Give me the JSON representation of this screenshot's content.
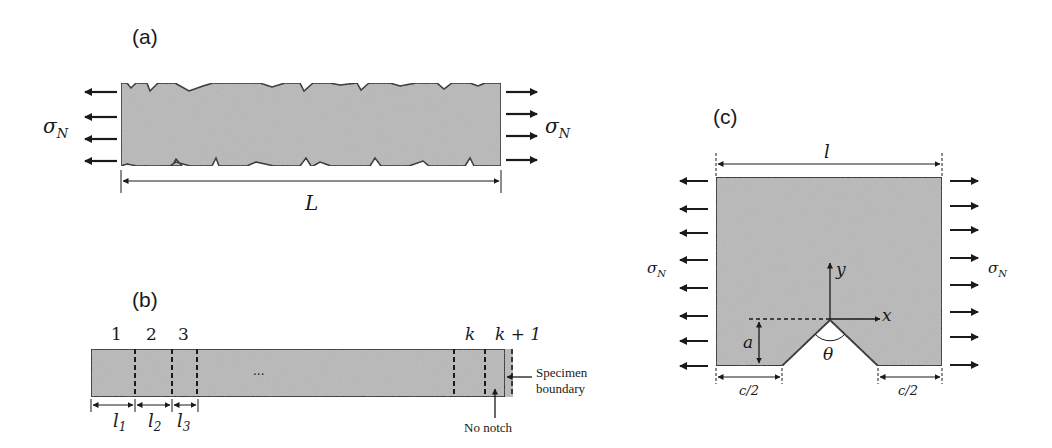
{
  "figure": {
    "background": "#ffffff",
    "specimen_fill": "#b9b9b9",
    "stroke_color": "#1a1a1a"
  },
  "panel_a": {
    "label": "(a)",
    "stress_left": "σ",
    "stress_left_sub": "N",
    "stress_right": "σ",
    "stress_right_sub": "N",
    "length_label": "L",
    "arrows_per_side": 4
  },
  "panel_b": {
    "label": "(b)",
    "segment_labels": [
      "1",
      "2",
      "3",
      "k",
      "k + 1"
    ],
    "length_labels": [
      {
        "main": "l",
        "sub": "1"
      },
      {
        "main": "l",
        "sub": "2"
      },
      {
        "main": "l",
        "sub": "3"
      }
    ],
    "ellipsis": "···",
    "no_notch_label": "No notch",
    "boundary_label_line1": "Specimen",
    "boundary_label_line2": "boundary"
  },
  "panel_c": {
    "label": "(c)",
    "width_label": "l",
    "stress_left": "σ",
    "stress_left_sub": "N",
    "stress_right": "σ",
    "stress_right_sub": "N",
    "axis_x": "x",
    "axis_y": "y",
    "notch_depth_label": "a",
    "notch_angle_label": "θ",
    "half_width_left": "c/2",
    "half_width_right": "c/2",
    "arrows_per_side": 8
  }
}
